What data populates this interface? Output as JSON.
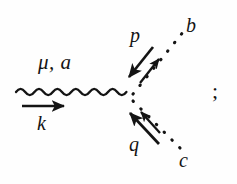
{
  "figure": {
    "background_color": "#fefefe",
    "ink_color": "#141414",
    "trailing_punctuation": ";"
  },
  "labels": {
    "incoming_index": "μ, a",
    "incoming_momentum": "k",
    "upper_momentum": "p",
    "upper_particle": "b",
    "lower_momentum": "q",
    "lower_particle": "c"
  },
  "legs": [
    {
      "id": "incoming-gluon",
      "style": "wavy",
      "from": [
        16,
        92
      ],
      "to": [
        131,
        96
      ],
      "index_label": "μ, a",
      "momentum_label": "k",
      "momentum_direction": "right",
      "momentum_arrow": {
        "from": [
          22,
          106
        ],
        "to": [
          66,
          106
        ]
      }
    },
    {
      "id": "upper-scalar",
      "style": "dotted",
      "from": [
        132,
        95
      ],
      "to": [
        186,
        28
      ],
      "particle_label": "b",
      "momentum_label": "p",
      "momentum_direction": "outgoing",
      "line_arrow": {
        "from": [
          141,
          82
        ],
        "to": [
          160,
          58
        ]
      },
      "momentum_arrow": {
        "from": [
          152,
          48
        ],
        "to": [
          128,
          78
        ]
      }
    },
    {
      "id": "lower-scalar",
      "style": "dotted",
      "from": [
        132,
        100
      ],
      "to": [
        180,
        150
      ],
      "particle_label": "c",
      "momentum_label": "q",
      "momentum_direction": "incoming",
      "line_arrow": {
        "from": [
          158,
          131
        ],
        "to": [
          139,
          110
        ]
      },
      "momentum_arrow": {
        "from": [
          158,
          143
        ],
        "to": [
          129,
          113
        ]
      }
    }
  ],
  "vertex": {
    "x": 132,
    "y": 97
  }
}
